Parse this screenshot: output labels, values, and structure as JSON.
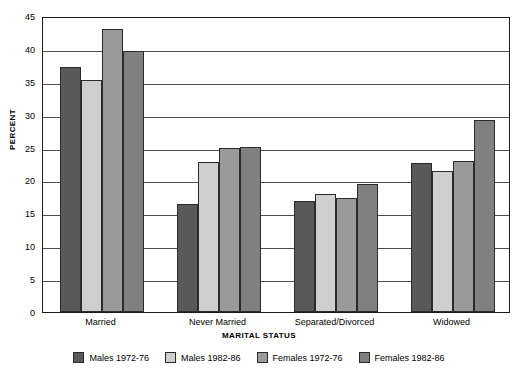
{
  "chart_data": {
    "type": "bar",
    "title": "",
    "xlabel": "MARITAL STATUS",
    "ylabel": "PERCENT",
    "ylim": [
      0,
      45
    ],
    "yticks": [
      0,
      5,
      10,
      15,
      20,
      25,
      30,
      35,
      40,
      45
    ],
    "grid": true,
    "legend_position": "bottom",
    "categories": [
      "Married",
      "Never Married",
      "Separated/Divorced",
      "Widowed"
    ],
    "series": [
      {
        "name": "Males 1972-76",
        "color": "#595959",
        "values": [
          37.3,
          16.4,
          16.9,
          22.6
        ]
      },
      {
        "name": "Males 1982-86",
        "color": "#cfcfcf",
        "values": [
          35.3,
          22.8,
          17.9,
          21.5
        ]
      },
      {
        "name": "Females 1972-76",
        "color": "#9a9a9a",
        "values": [
          43.0,
          25.0,
          17.3,
          23.0
        ]
      },
      {
        "name": "Females 1982-86",
        "color": "#808080",
        "values": [
          39.7,
          25.1,
          19.5,
          29.2
        ]
      }
    ]
  }
}
